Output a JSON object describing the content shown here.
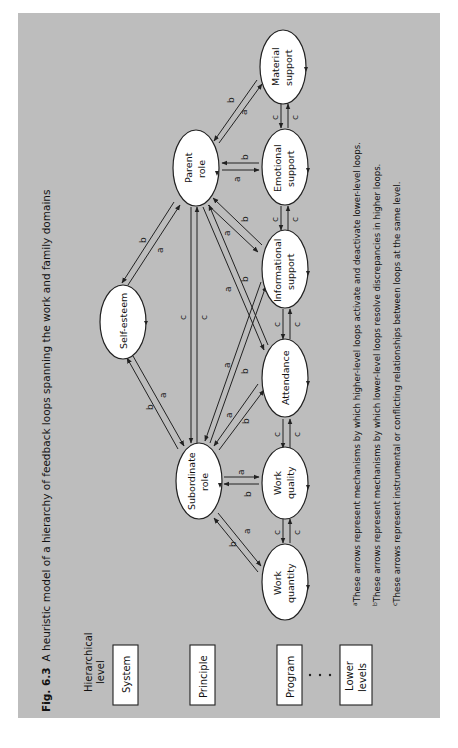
{
  "figure": {
    "label": "Fig. 6.3",
    "caption": "A heuristic model of a hierarchy of feedback loops spanning the work and family domains",
    "orientation": "rotated 90 degrees counter-clockwise"
  },
  "hierarchy": {
    "header": [
      "Hierarchical",
      "level"
    ],
    "levels": [
      {
        "label": [
          "System"
        ]
      },
      {
        "label": [
          "Principle"
        ]
      },
      {
        "label": [
          "Program"
        ]
      },
      {
        "label": [
          "Lower",
          "levels"
        ]
      }
    ],
    "ellipsis": "..."
  },
  "nodes": {
    "self_esteem": {
      "label": [
        "Self-esteem"
      ],
      "level": "System"
    },
    "parent_role": {
      "label": [
        "Parent",
        "role"
      ],
      "level": "Principle"
    },
    "subordinate_role": {
      "label": [
        "Subordinate",
        "role"
      ],
      "level": "Principle"
    },
    "material_support": {
      "label": [
        "Material",
        "support"
      ],
      "level": "Program"
    },
    "emotional_support": {
      "label": [
        "Emotional",
        "support"
      ],
      "level": "Program"
    },
    "informational_support": {
      "label": [
        "Informational",
        "support"
      ],
      "level": "Program"
    },
    "attendance": {
      "label": [
        "Attendance"
      ],
      "level": "Program"
    },
    "work_quality": {
      "label": [
        "Work",
        "quality"
      ],
      "level": "Program"
    },
    "work_quantity": {
      "label": [
        "Work",
        "quantity"
      ],
      "level": "Program"
    }
  },
  "edges": [
    {
      "from": "self_esteem",
      "to": "parent_role",
      "labels": [
        "a",
        "b"
      ]
    },
    {
      "from": "self_esteem",
      "to": "subordinate_role",
      "labels": [
        "a",
        "b"
      ]
    },
    {
      "from": "parent_role",
      "to": "subordinate_role",
      "labels": [
        "c",
        "c"
      ]
    },
    {
      "from": "parent_role",
      "to": "material_support",
      "labels": [
        "a",
        "b"
      ]
    },
    {
      "from": "parent_role",
      "to": "emotional_support",
      "labels": [
        "a",
        "b"
      ]
    },
    {
      "from": "parent_role",
      "to": "informational_support",
      "labels": [
        "a",
        "b"
      ]
    },
    {
      "from": "parent_role",
      "to": "attendance",
      "labels": [
        "a",
        "b"
      ]
    },
    {
      "from": "subordinate_role",
      "to": "informational_support",
      "labels": [
        "a",
        "b"
      ]
    },
    {
      "from": "subordinate_role",
      "to": "attendance",
      "labels": [
        "a",
        "b"
      ]
    },
    {
      "from": "subordinate_role",
      "to": "work_quality",
      "labels": [
        "a",
        "b"
      ]
    },
    {
      "from": "subordinate_role",
      "to": "work_quantity",
      "labels": [
        "a",
        "b"
      ]
    },
    {
      "from": "material_support",
      "to": "emotional_support",
      "labels": [
        "c",
        "c"
      ]
    },
    {
      "from": "emotional_support",
      "to": "informational_support",
      "labels": [
        "c",
        "c"
      ]
    },
    {
      "from": "informational_support",
      "to": "attendance",
      "labels": [
        "c",
        "c"
      ]
    },
    {
      "from": "attendance",
      "to": "work_quality",
      "labels": [
        "c",
        "c"
      ]
    },
    {
      "from": "work_quality",
      "to": "work_quantity",
      "labels": [
        "c",
        "c"
      ]
    }
  ],
  "edge_labels": {
    "a": "a",
    "b": "b",
    "c": "c"
  },
  "footnotes": [
    {
      "marker": "a",
      "text": "These arrows represent mechanisms by which higher-level loops activate and deactivate lower-level loops."
    },
    {
      "marker": "b",
      "text": "These arrows represent mechanisms by which lower-level loops resolve discrepancies in higher loops."
    },
    {
      "marker": "c",
      "text": "These arrows represent instrumental or conflicting relationships between loops at the same level."
    }
  ]
}
